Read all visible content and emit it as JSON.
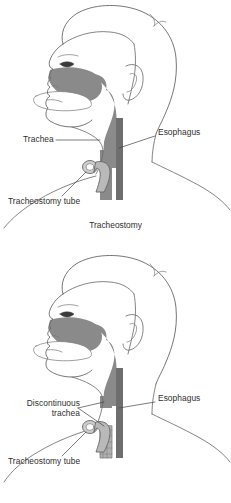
{
  "figure": {
    "title": "Tracheostomy",
    "background_color": "#ffffff",
    "line_color": "#555555",
    "airway_fill": "#8a8a8a",
    "esophagus_fill": "#6e6e6e",
    "tube_fill": "#b9b9b9",
    "text_color": "#2f2f2f"
  },
  "panels": [
    {
      "id": "tracheostomy",
      "caption": "Tracheostomy",
      "labels": {
        "trachea": "Trachea",
        "esophagus": "Esophagus",
        "tracheostomy_tube": "Tracheostomy tube"
      }
    },
    {
      "id": "discontinuous-trachea",
      "caption": "",
      "labels": {
        "trachea_line1": "Discontinuous",
        "trachea_line2": "trachea",
        "esophagus": "Esophagus",
        "tracheostomy_tube": "Tracheostomy tube"
      }
    }
  ]
}
